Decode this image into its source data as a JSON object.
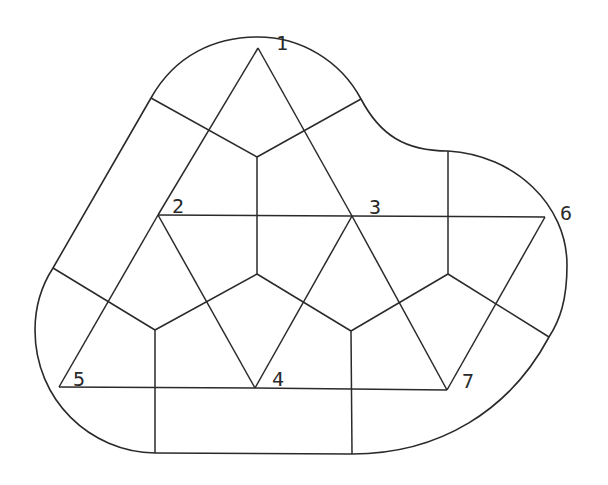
{
  "diagram": {
    "type": "delaunay-triangulation-with-voronoi-regions",
    "nodes": [
      {
        "id": "1",
        "label": "1",
        "x": 258,
        "y": 48,
        "lx": 276,
        "ly": 50
      },
      {
        "id": "2",
        "label": "2",
        "x": 158,
        "y": 215,
        "lx": 172,
        "ly": 213
      },
      {
        "id": "3",
        "label": "3",
        "x": 352,
        "y": 216,
        "lx": 369,
        "ly": 214
      },
      {
        "id": "6",
        "label": "6",
        "x": 545,
        "y": 217,
        "lx": 560,
        "ly": 220
      },
      {
        "id": "5",
        "label": "5",
        "x": 59,
        "y": 387,
        "lx": 73,
        "ly": 386
      },
      {
        "id": "4",
        "label": "4",
        "x": 255,
        "y": 388,
        "lx": 272,
        "ly": 386
      },
      {
        "id": "7",
        "label": "7",
        "x": 447,
        "y": 390,
        "lx": 462,
        "ly": 388
      }
    ],
    "delaunay_edges": [
      [
        "1",
        "2"
      ],
      [
        "1",
        "3"
      ],
      [
        "2",
        "3"
      ],
      [
        "3",
        "6"
      ],
      [
        "2",
        "5"
      ],
      [
        "2",
        "4"
      ],
      [
        "3",
        "4"
      ],
      [
        "3",
        "7"
      ],
      [
        "6",
        "7"
      ],
      [
        "5",
        "4"
      ],
      [
        "4",
        "7"
      ]
    ],
    "voronoi_vertices": {
      "a": [
        257,
        157
      ],
      "b": [
        155,
        330
      ],
      "c": [
        257,
        274
      ],
      "d": [
        351,
        331
      ],
      "e": [
        448,
        274
      ]
    },
    "voronoi_edges": [
      [
        "a",
        "c"
      ],
      [
        "c",
        "b"
      ],
      [
        "c",
        "d"
      ],
      [
        "d",
        "e"
      ]
    ],
    "voronoi_boundary_edges": [
      [
        [
          257,
          157
        ],
        [
          151,
          98
        ]
      ],
      [
        [
          257,
          157
        ],
        [
          361,
          99
        ]
      ],
      [
        [
          155,
          330
        ],
        [
          53,
          268
        ]
      ],
      [
        [
          155,
          330
        ],
        [
          155,
          453
        ]
      ],
      [
        [
          351,
          331
        ],
        [
          352,
          454
        ]
      ],
      [
        [
          448,
          274
        ],
        [
          448,
          151
        ]
      ],
      [
        [
          448,
          274
        ],
        [
          549,
          337
        ]
      ]
    ],
    "colors": {
      "stroke": "#2a2a2a",
      "background": "#ffffff"
    }
  }
}
